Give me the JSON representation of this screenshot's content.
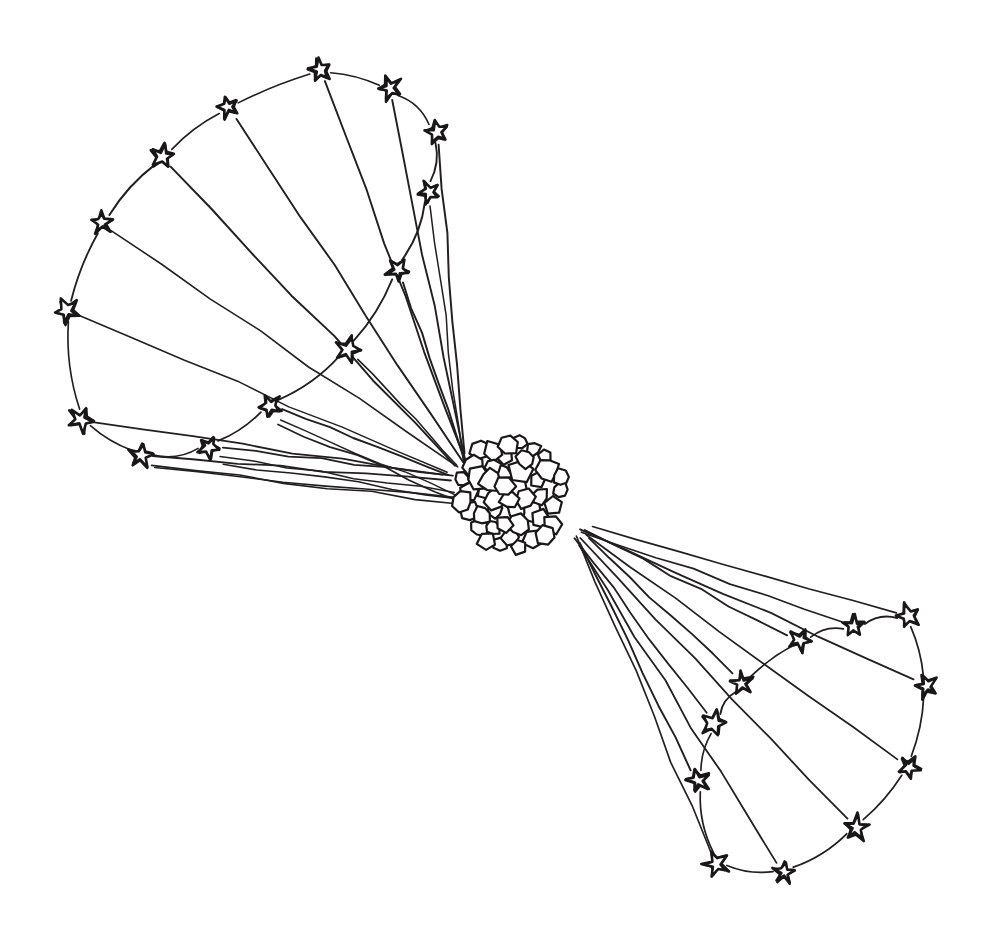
{
  "figure": {
    "title": "Two star clusters radiating toward a central globular cluster",
    "medium": "hand-drawn ink line illustration",
    "background_color": "#ffffff",
    "ink_color": "#231f20",
    "star_fill_color": "#ffffff",
    "width": 996,
    "height": 934
  },
  "chart_data": {
    "type": "diagram",
    "title": "Two star clusters radiating toward a central globular cluster",
    "xlabel": "",
    "ylabel": "",
    "grid": false,
    "legend": "none",
    "xlim": [
      0,
      996
    ],
    "ylim": [
      0,
      934
    ],
    "center_cluster": {
      "name": "central-cluster",
      "center_x": 512,
      "center_y": 492,
      "radius_x": 52,
      "radius_y": 57,
      "cell_count": 46,
      "description": "dense blob of irregular rounded polygon cells"
    },
    "groups": [
      {
        "name": "upper-left-constellation",
        "star_count": 14,
        "stars": [
          {
            "id": "L1",
            "x": 320,
            "y": 70
          },
          {
            "id": "L2",
            "x": 390,
            "y": 88
          },
          {
            "id": "L3",
            "x": 437,
            "y": 132
          },
          {
            "id": "L4",
            "x": 429,
            "y": 192
          },
          {
            "id": "L5",
            "x": 398,
            "y": 270
          },
          {
            "id": "L6",
            "x": 348,
            "y": 350
          },
          {
            "id": "L7",
            "x": 270,
            "y": 406
          },
          {
            "id": "L8",
            "x": 209,
            "y": 447
          },
          {
            "id": "L9",
            "x": 141,
            "y": 456
          },
          {
            "id": "L10",
            "x": 81,
            "y": 420
          },
          {
            "id": "L11",
            "x": 67,
            "y": 311
          },
          {
            "id": "L12",
            "x": 102,
            "y": 223
          },
          {
            "id": "L13",
            "x": 163,
            "y": 156
          },
          {
            "id": "L14",
            "x": 228,
            "y": 107
          }
        ],
        "arc_chain": [
          "L1",
          "L2",
          "L3",
          "L4",
          "L5",
          "L6",
          "L7",
          "L8",
          "L9",
          "L10",
          "L11",
          "L12",
          "L13",
          "L14",
          "L1"
        ],
        "ray_target_x": 470,
        "ray_target_y": 480
      },
      {
        "name": "lower-right-constellation",
        "star_count": 11,
        "stars": [
          {
            "id": "R1",
            "x": 908,
            "y": 616
          },
          {
            "id": "R2",
            "x": 854,
            "y": 626
          },
          {
            "id": "R3",
            "x": 800,
            "y": 640
          },
          {
            "id": "R4",
            "x": 742,
            "y": 683
          },
          {
            "id": "R5",
            "x": 714,
            "y": 723
          },
          {
            "id": "R6",
            "x": 698,
            "y": 781
          },
          {
            "id": "R7",
            "x": 716,
            "y": 864
          },
          {
            "id": "R8",
            "x": 784,
            "y": 873
          },
          {
            "id": "R9",
            "x": 856,
            "y": 828
          },
          {
            "id": "R10",
            "x": 909,
            "y": 767
          },
          {
            "id": "R11",
            "x": 926,
            "y": 686
          }
        ],
        "arc_chain": [
          "R1",
          "R2",
          "R3",
          "R4",
          "R5",
          "R6",
          "R7",
          "R8",
          "R9",
          "R10",
          "R11",
          "R1"
        ],
        "ray_target_x": 566,
        "ray_target_y": 524
      }
    ]
  }
}
